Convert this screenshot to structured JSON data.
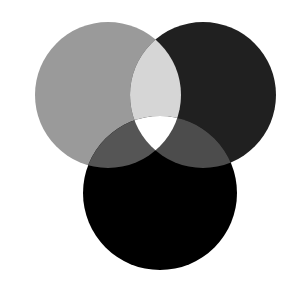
{
  "diagram": {
    "type": "venn",
    "sets": 3,
    "background": "#ffffff",
    "circles": [
      {
        "id": "left",
        "cx": 108,
        "cy": 95,
        "r": 73,
        "fill": "#9a9a9a"
      },
      {
        "id": "right",
        "cx": 203,
        "cy": 95,
        "r": 73,
        "fill": "#202020"
      },
      {
        "id": "bottom",
        "cx": 160,
        "cy": 193,
        "r": 77,
        "fill": "#000000"
      }
    ],
    "regions": {
      "left_right": "#d6d6d6",
      "left_bottom": "#555555",
      "right_bottom": "#4c4c4c",
      "all_three": "#ffffff"
    }
  }
}
